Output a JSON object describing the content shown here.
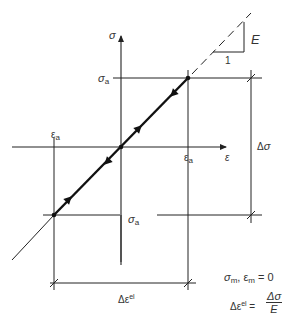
{
  "diagram": {
    "axes": {
      "y_label": "σ",
      "x_label": "ε"
    },
    "labels": {
      "sigma_a_top": {
        "base": "σ",
        "sub": "a"
      },
      "sigma_a_bottom": {
        "base": "σ",
        "sub": "a"
      },
      "eps_a_left": {
        "base": "ε",
        "sub": "a"
      },
      "eps_a_right": {
        "base": "ε",
        "sub": "a"
      },
      "delta_sigma": "Δσ",
      "delta_eps": {
        "base": "Δε",
        "sup": "el"
      },
      "slope_E": "E",
      "slope_1": "1"
    },
    "equations": {
      "mean_zero": {
        "s": "σ",
        "s_sub": "m",
        "sep": ", ",
        "e": "ε",
        "e_sub": "m",
        "rhs": " = 0"
      },
      "delta_eps_el": {
        "lhs": "Δε",
        "lhs_sup": "el",
        "eq": " = ",
        "num": "Δσ",
        "den": "E"
      }
    },
    "colors": {
      "line": "#222222",
      "background": "#ffffff"
    }
  }
}
